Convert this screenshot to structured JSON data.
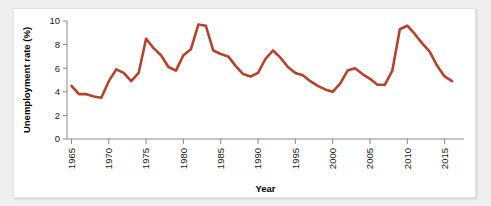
{
  "chart_data": {
    "type": "line",
    "title": "",
    "xlabel": "Year",
    "ylabel": "Unemployment rate (%)",
    "xlim": [
      1965,
      1967.5
    ],
    "ylim": [
      0,
      10
    ],
    "xticks": [
      1965,
      1970,
      1975,
      1980,
      1985,
      1990,
      1995,
      2000,
      2005,
      2010,
      2015
    ],
    "xtick_labels": [
      "1965",
      "1970",
      "1975",
      "1980",
      "1985",
      "1990",
      "1995",
      "2000",
      "2005",
      "2010",
      "2015"
    ],
    "yticks": [
      0,
      2,
      4,
      6,
      8,
      10
    ],
    "ytick_labels": [
      "0",
      "2",
      "4",
      "6",
      "8",
      "10"
    ],
    "grid": false,
    "legend": "none",
    "line_color": "#b5432a",
    "axis_color": "#8a8a8a",
    "x_axis_start": 1964.4,
    "x_axis_end": 2017.6,
    "series": [
      {
        "name": "Unemployment rate",
        "x": [
          1965,
          1966,
          1967,
          1968,
          1969,
          1970,
          1971,
          1972,
          1973,
          1974,
          1975,
          1976,
          1977,
          1978,
          1979,
          1980,
          1981,
          1982,
          1983,
          1984,
          1985,
          1986,
          1987,
          1988,
          1989,
          1990,
          1991,
          1992,
          1993,
          1994,
          1995,
          1996,
          1997,
          1998,
          1999,
          2000,
          2001,
          2002,
          2003,
          2004,
          2005,
          2006,
          2007,
          2008,
          2009,
          2010,
          2011,
          2012,
          2013,
          2014,
          2015,
          2016
        ],
        "values": [
          4.5,
          3.8,
          3.8,
          3.6,
          3.5,
          4.9,
          5.9,
          5.6,
          4.9,
          5.6,
          8.5,
          7.7,
          7.1,
          6.1,
          5.8,
          7.1,
          7.6,
          9.7,
          9.6,
          7.5,
          7.2,
          7.0,
          6.2,
          5.5,
          5.3,
          5.6,
          6.8,
          7.5,
          6.9,
          6.1,
          5.6,
          5.4,
          4.9,
          4.5,
          4.2,
          4.0,
          4.7,
          5.8,
          6.0,
          5.5,
          5.1,
          4.6,
          4.6,
          5.8,
          9.3,
          9.6,
          8.9,
          8.1,
          7.4,
          6.2,
          5.3,
          4.9
        ]
      }
    ]
  }
}
